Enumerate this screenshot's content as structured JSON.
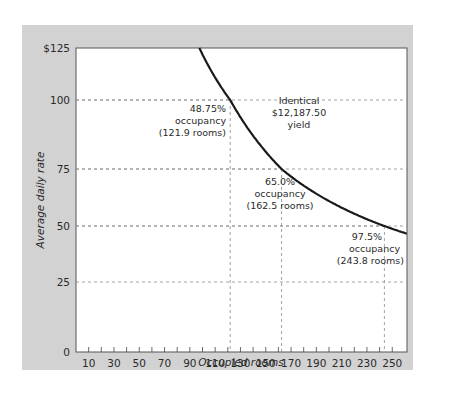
{
  "chart_data": {
    "type": "line",
    "title": "",
    "xlabel": "Occupied rooms",
    "ylabel": "Average daily rate",
    "xlim": [
      0,
      262
    ],
    "ylim": [
      0,
      125
    ],
    "x_ticks": [
      10,
      30,
      50,
      70,
      90,
      110,
      130,
      150,
      170,
      190,
      210,
      230,
      250
    ],
    "x_minor_ticks": [
      10,
      20,
      30,
      40,
      50,
      60,
      70,
      80,
      90,
      100,
      110,
      120,
      130,
      140,
      150,
      160,
      170,
      180,
      190,
      200,
      210,
      220,
      230,
      240,
      250
    ],
    "y_ticks": [
      0,
      25,
      50,
      75,
      100,
      125
    ],
    "y_tick_labels": [
      "0",
      "25",
      "50",
      "75",
      "100",
      "$125"
    ],
    "grid": "dashed horizontal at 25, 50, 75, 100",
    "series": [
      {
        "name": "Identical yield curve (rate × rooms = 12187.50)",
        "formula": "y = 12187.5 / x",
        "x": [
          97.5,
          110,
          121.9,
          140,
          162.5,
          180,
          200,
          220,
          243.8,
          262
        ],
        "values": [
          125,
          110.8,
          100,
          87.05,
          75,
          67.71,
          60.94,
          55.4,
          50,
          46.52
        ]
      }
    ],
    "reference_points": [
      {
        "rooms": 121.9,
        "rate": 100,
        "label": [
          "48.75%",
          "occupancy",
          "(121.9 rooms)"
        ]
      },
      {
        "rooms": 162.5,
        "rate": 75,
        "label": [
          "65.0%",
          "occupancy",
          "(162.5 rooms)"
        ]
      },
      {
        "rooms": 243.8,
        "rate": 50,
        "label": [
          "97.5%",
          "occupancy",
          "(243.8 rooms)"
        ]
      }
    ],
    "annotations": [
      {
        "text": [
          "Identical",
          "$12,187.50",
          "yield"
        ]
      }
    ]
  },
  "labels": {
    "xlabel": "Occupied rooms",
    "ylabel": "Average daily rate",
    "yield_line1": "Identical",
    "yield_line2": "$12,187.50",
    "yield_line3": "yield",
    "p1_line1": "48.75%",
    "p1_line2": "occupancy",
    "p1_line3": "(121.9 rooms)",
    "p2_line1": "65.0%",
    "p2_line2": "occupancy",
    "p2_line3": "(162.5 rooms)",
    "p3_line1": "97.5%",
    "p3_line2": "occupancy",
    "p3_line3": "(243.8 rooms)"
  },
  "colors": {
    "panel": "#d2d2d2",
    "plot_bg": "#ffffff",
    "curve": "#1a1a1a",
    "grid": "#8a8a8a",
    "text": "#2a2a2a"
  }
}
